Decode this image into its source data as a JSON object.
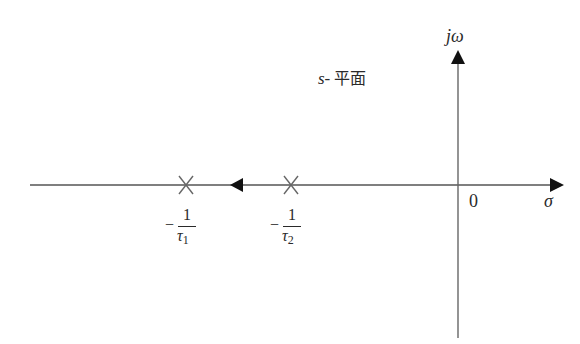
{
  "diagram": {
    "type": "root-locus",
    "plane_label": {
      "var": "s-",
      "text": "平面"
    },
    "axes": {
      "imag_label": "jω",
      "real_label": "σ",
      "origin_label": "0"
    },
    "poles": [
      {
        "id": "p1",
        "label_minus": "−",
        "label_num": "1",
        "label_den": "τ",
        "label_sub": "1"
      },
      {
        "id": "p2",
        "label_minus": "−",
        "label_num": "1",
        "label_den": "τ",
        "label_sub": "2"
      }
    ],
    "locus_direction": "left",
    "colors": {
      "line": "#555555",
      "text": "#2a2a2a",
      "arrow": "#111111",
      "background": "#ffffff"
    }
  }
}
